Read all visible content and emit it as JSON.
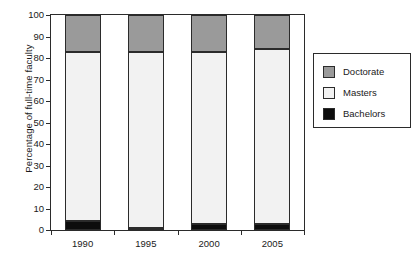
{
  "chart_data": {
    "type": "bar",
    "stacked": true,
    "title": "",
    "xlabel": "",
    "ylabel": "Percentage of full-time faculty",
    "categories": [
      "1990",
      "1995",
      "2000",
      "2005"
    ],
    "ylim": [
      0,
      100
    ],
    "yticks": [
      0,
      10,
      20,
      30,
      40,
      50,
      60,
      70,
      80,
      90,
      100
    ],
    "ytick_labels": [
      "0",
      "10",
      "20",
      "30",
      "40",
      "50",
      "60",
      "70",
      "80",
      "90",
      "100"
    ],
    "grid": false,
    "legend_position": "right",
    "series": [
      {
        "name": "Doctorate",
        "color": "#9a9a9a",
        "values": [
          17,
          17,
          17,
          16
        ]
      },
      {
        "name": "Masters",
        "color": "#f2f2f2",
        "values": [
          79,
          82,
          80,
          81
        ]
      },
      {
        "name": "Bachelors",
        "color": "#0d0d0d",
        "values": [
          4,
          1,
          3,
          3
        ]
      }
    ],
    "stack_order": [
      "Bachelors",
      "Masters",
      "Doctorate"
    ]
  },
  "legend": {
    "items": [
      {
        "label": "Doctorate",
        "swatch": "doctorate"
      },
      {
        "label": "Masters",
        "swatch": "masters"
      },
      {
        "label": "Bachelors",
        "swatch": "bachelors"
      }
    ]
  }
}
